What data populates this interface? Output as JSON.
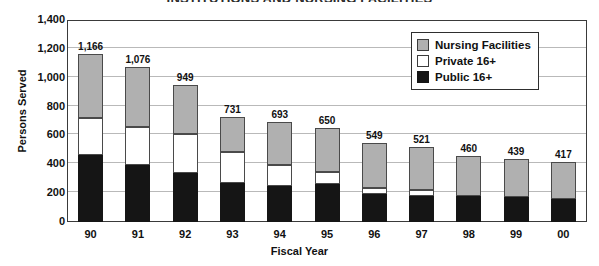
{
  "chart_data": {
    "type": "bar",
    "subtype": "stacked-vertical",
    "title": "INSTITUTIONS AND NURSING FACILITIES",
    "xlabel": "Fiscal Year",
    "ylabel": "Persons Served",
    "categories": [
      "90",
      "91",
      "92",
      "93",
      "94",
      "95",
      "96",
      "97",
      "98",
      "99",
      "00"
    ],
    "ylim": [
      0,
      1400
    ],
    "yticks": [
      "0",
      "200",
      "400",
      "600",
      "800",
      "1,000",
      "1,200",
      "1,400"
    ],
    "ytick_values": [
      0,
      200,
      400,
      600,
      800,
      1000,
      1200,
      1400
    ],
    "grid": true,
    "legend_position": "top-right",
    "series": [
      {
        "name": "Public 16+",
        "color": "#151515",
        "values": [
          465,
          395,
          340,
          270,
          250,
          265,
          195,
          180,
          180,
          175,
          160
        ]
      },
      {
        "name": "Private 16+",
        "color": "#ffffff",
        "values": [
          255,
          265,
          270,
          215,
          145,
          85,
          40,
          40,
          0,
          0,
          0
        ]
      },
      {
        "name": "Nursing Facilities",
        "color": "#b0b0b0",
        "values": [
          446,
          416,
          339,
          246,
          298,
          300,
          314,
          301,
          280,
          264,
          257
        ]
      }
    ],
    "totals": [
      1166,
      1076,
      949,
      731,
      693,
      650,
      549,
      521,
      460,
      439,
      417
    ],
    "total_labels": [
      "1,166",
      "1,076",
      "949",
      "731",
      "693",
      "650",
      "549",
      "521",
      "460",
      "439",
      "417"
    ]
  },
  "legend": {
    "items": [
      {
        "label": "Nursing Facilities",
        "swatch": "gray"
      },
      {
        "label": "Private 16+",
        "swatch": "white"
      },
      {
        "label": "Public 16+",
        "swatch": "black"
      }
    ]
  }
}
